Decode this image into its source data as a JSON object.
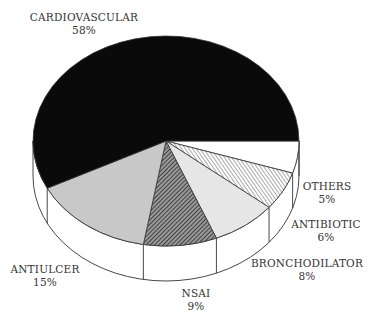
{
  "chart_data": {
    "type": "pie",
    "style": "3d-exploded-none",
    "title": "",
    "slices": [
      {
        "label": "CARDIOVASCULAR",
        "value": 58,
        "display": "58%",
        "fill": "solid-black"
      },
      {
        "label": "ANTIULCER",
        "value": 15,
        "display": "15%",
        "fill": "light-grey"
      },
      {
        "label": "NSAI",
        "value": 9,
        "display": "9%",
        "fill": "dark-hatch"
      },
      {
        "label": "BRONCHODILATOR",
        "value": 8,
        "display": "8%",
        "fill": "very-light-grey"
      },
      {
        "label": "ANTIBIOTIC",
        "value": 6,
        "display": "6%",
        "fill": "diagonal-hatch"
      },
      {
        "label": "OTHERS",
        "value": 5,
        "display": "5%",
        "fill": "white"
      }
    ],
    "legend": "none (labels next to slices)"
  },
  "labels": {
    "cardiovascular": {
      "name": "CARDIOVASCULAR",
      "pct": "58%"
    },
    "antiulcer": {
      "name": "ANTIULCER",
      "pct": "15%"
    },
    "nsai": {
      "name": "NSAI",
      "pct": "9%"
    },
    "bronchodilator": {
      "name": "BRONCHODILATOR",
      "pct": "8%"
    },
    "antibiotic": {
      "name": "ANTIBIOTIC",
      "pct": "6%"
    },
    "others": {
      "name": "OTHERS",
      "pct": "5%"
    }
  },
  "colors": {
    "black": "#0a0a0a",
    "light_grey": "#c8c8c8",
    "very_light_grey": "#e6e6e6",
    "hatch_dark": "#444444",
    "outline": "#333333"
  }
}
